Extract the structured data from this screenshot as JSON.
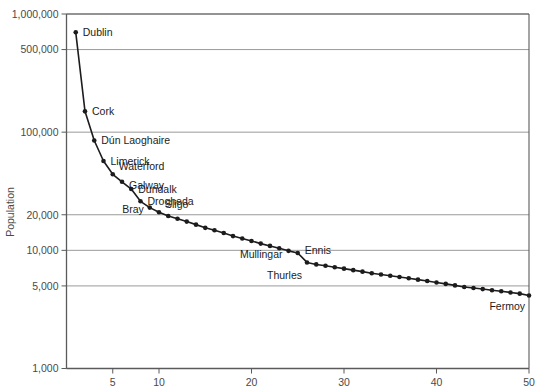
{
  "chart_data": {
    "type": "line",
    "title": "",
    "subtitle": "",
    "xlabel": "",
    "ylabel": "Population",
    "yscale": "log",
    "xscale": "linear",
    "xlim": [
      0,
      50
    ],
    "ylim": [
      1000,
      1000000
    ],
    "grid": true,
    "legend": "none",
    "x_ticks": [
      5,
      10,
      20,
      30,
      40,
      50
    ],
    "x_tick_labels": [
      "5",
      "10",
      "20",
      "30",
      "40",
      "50"
    ],
    "y_ticks": [
      1000,
      5000,
      10000,
      20000,
      100000,
      500000,
      1000000
    ],
    "y_tick_labels": [
      "1,000",
      "5,000",
      "10,000",
      "20,000",
      "100,000",
      "500,000",
      "1,000,000"
    ],
    "marker": "filled-circle",
    "line_color": "#1c1c1c",
    "marker_color": "#1c1c1c",
    "grid_color": "#9a9a9a",
    "axis_color": "#5a5a5a",
    "series": [
      {
        "name": "Irish towns by population rank",
        "x": [
          1,
          2,
          3,
          4,
          5,
          6,
          7,
          8,
          9,
          10,
          11,
          12,
          13,
          14,
          15,
          16,
          17,
          18,
          19,
          20,
          21,
          22,
          23,
          24,
          25,
          26,
          27,
          28,
          29,
          30,
          31,
          32,
          33,
          34,
          35,
          36,
          37,
          38,
          39,
          40,
          41,
          42,
          43,
          44,
          45,
          46,
          47,
          48,
          49,
          50
        ],
        "values": [
          700000,
          150000,
          85000,
          57000,
          44000,
          38000,
          33000,
          26000,
          23000,
          21000,
          19500,
          18500,
          17500,
          16500,
          15500,
          14800,
          14000,
          13200,
          12600,
          12000,
          11400,
          10900,
          10400,
          9900,
          9500,
          7900,
          7600,
          7400,
          7200,
          7000,
          6800,
          6600,
          6400,
          6250,
          6100,
          5950,
          5800,
          5650,
          5500,
          5350,
          5200,
          5050,
          4900,
          4800,
          4700,
          4600,
          4500,
          4400,
          4300,
          4150
        ]
      }
    ],
    "annotations": [
      {
        "label": "Dublin",
        "rank": 1,
        "value": 700000,
        "anchor": "right"
      },
      {
        "label": "Cork",
        "rank": 2,
        "value": 150000,
        "anchor": "right"
      },
      {
        "label": "Dún Laoghaire",
        "rank": 3,
        "value": 85000,
        "anchor": "right"
      },
      {
        "label": "Limerick",
        "rank": 4,
        "value": 57000,
        "anchor": "right"
      },
      {
        "label": "Waterford",
        "rank": 5,
        "value": 44000,
        "anchor": "right"
      },
      {
        "label": "Galway",
        "rank": 6,
        "value": 38000,
        "anchor": "right"
      },
      {
        "label": "Dundalk",
        "rank": 7,
        "value": 33000,
        "anchor": "right"
      },
      {
        "label": "Drogheda",
        "rank": 8,
        "value": 26000,
        "anchor": "right"
      },
      {
        "label": "Sligo",
        "rank": 10,
        "value": 21000,
        "anchor": "right"
      },
      {
        "label": "Bray",
        "rank": 9,
        "value": 23000,
        "anchor": "left"
      },
      {
        "label": "Ennis",
        "rank": 25,
        "value": 9500,
        "anchor": "right"
      },
      {
        "label": "Mullingar",
        "rank": 24,
        "value": 9900,
        "anchor": "left"
      },
      {
        "label": "Thurles",
        "rank": 26,
        "value": 7900,
        "anchor": "left"
      },
      {
        "label": "Fermoy",
        "rank": 50,
        "value": 4150,
        "anchor": "left"
      }
    ]
  },
  "axes": {
    "y_title": "Population",
    "y_labels": [
      "1,000,000",
      "500,000",
      "100,000",
      "20,000",
      "10,000",
      "5,000",
      "1,000"
    ],
    "x_labels": [
      "5",
      "10",
      "20",
      "30",
      "40",
      "50"
    ]
  },
  "labels": {
    "dublin": "Dublin",
    "cork": "Cork",
    "dun_laoghaire": "Dún Laoghaire",
    "limerick": "Limerick",
    "waterford": "Waterford",
    "galway": "Galway",
    "dundalk": "Dundalk",
    "drogheda": "Drogheda",
    "sligo": "Sligo",
    "bray": "Bray",
    "ennis": "Ennis",
    "mullingar": "Mullingar",
    "thurles": "Thurles",
    "fermoy": "Fermoy"
  }
}
